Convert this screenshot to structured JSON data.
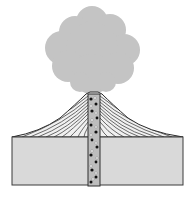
{
  "diagram": {
    "colors": {
      "background": "#ffffff",
      "ash_cloud": "#c4c4c4",
      "crust_block": "#d9d9d9",
      "outline": "#3a3a3a",
      "cone_strata": "#2e2e2e",
      "vent": "#bdbdbd",
      "magma_dark": "#111111",
      "magma_light": "#f4f4f4"
    },
    "parts": [
      {
        "id": "ash-cloud",
        "label": ""
      },
      {
        "id": "cone",
        "label": ""
      },
      {
        "id": "vent",
        "label": ""
      },
      {
        "id": "crust-block",
        "label": ""
      }
    ]
  }
}
